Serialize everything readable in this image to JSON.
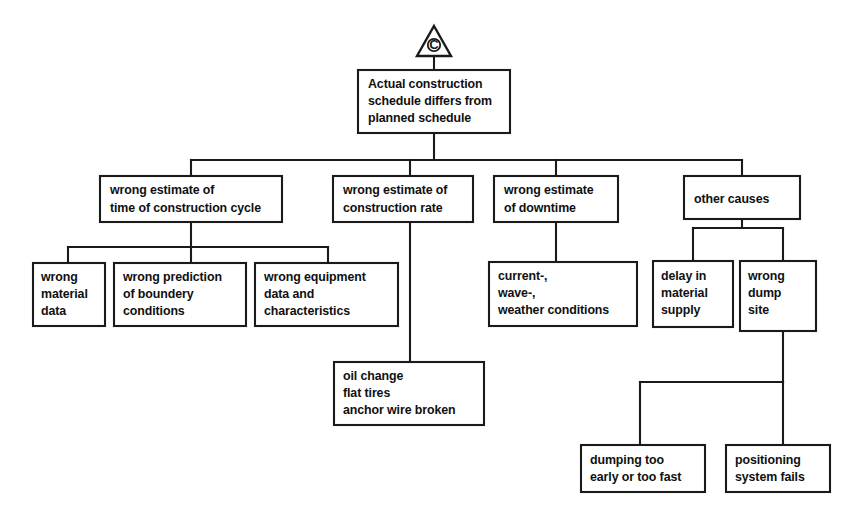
{
  "diagram": {
    "type": "fault-tree",
    "gate": {
      "symbol": "triangle-with-letter",
      "letter": "C",
      "name": "transfer-gate-c"
    },
    "colors": {
      "stroke": "#1a1a1a",
      "background": "#ffffff",
      "text": "#101010"
    },
    "nodes": {
      "top_event": {
        "lines": [
          "Actual construction",
          "schedule differs from",
          "planned schedule"
        ]
      },
      "cause_1": {
        "lines": [
          "wrong estimate of",
          "time of construction cycle"
        ]
      },
      "cause_2": {
        "lines": [
          "wrong estimate of",
          "construction rate"
        ]
      },
      "cause_3": {
        "lines": [
          "wrong estimate",
          "of downtime"
        ]
      },
      "cause_4": {
        "lines": [
          "other causes"
        ]
      },
      "leaf_1": {
        "lines": [
          "wrong",
          "material",
          "data"
        ]
      },
      "leaf_2": {
        "lines": [
          "wrong prediction",
          "of boundery",
          "conditions"
        ]
      },
      "leaf_3": {
        "lines": [
          "wrong equipment",
          "data and",
          "characteristics"
        ]
      },
      "leaf_4": {
        "lines": [
          "oil change",
          "flat tires",
          "anchor wire broken"
        ]
      },
      "leaf_5": {
        "lines": [
          "current-,",
          "wave-,",
          "weather conditions"
        ]
      },
      "leaf_6": {
        "lines": [
          "delay in",
          "material",
          "supply"
        ]
      },
      "leaf_7": {
        "lines": [
          "wrong",
          "dump",
          "site"
        ]
      },
      "leaf_8": {
        "lines": [
          "dumping too",
          "early or too fast"
        ]
      },
      "leaf_9": {
        "lines": [
          "positioning",
          "system fails"
        ]
      }
    }
  }
}
